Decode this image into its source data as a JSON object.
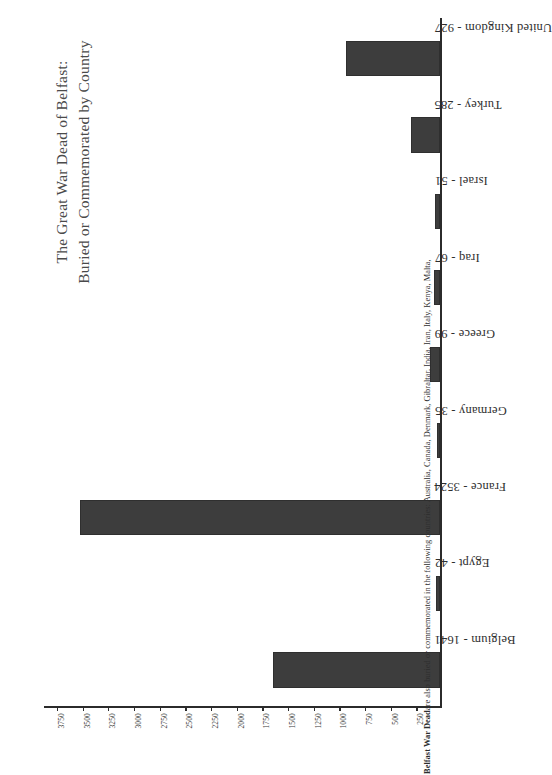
{
  "chart_data": {
    "type": "bar",
    "orientation": "horizontal",
    "title": "The Great War Dead of Belfast: Buried or Commemorated by Country",
    "title_lines": [
      "The Great War Dead of Belfast:",
      "Buried or Commemorated by Country"
    ],
    "xlabel": "",
    "ylabel": "",
    "grid": false,
    "legend": false,
    "axis_reversed": true,
    "xlim": [
      0,
      3875
    ],
    "tick_labels": [
      "3750",
      "3500",
      "3250",
      "3000",
      "2750",
      "2500",
      "2250",
      "2000",
      "1750",
      "1500",
      "1250",
      "1000",
      "750",
      "500",
      "250"
    ],
    "tick_values": [
      3750,
      3500,
      3250,
      3000,
      2750,
      2500,
      2250,
      2000,
      1750,
      1500,
      1250,
      1000,
      750,
      500,
      250
    ],
    "categories": [
      "Belgium",
      "Egypt",
      "France",
      "Germany",
      "Greece",
      "Iraq",
      "Israel",
      "Turkey",
      "United Kingdom"
    ],
    "values": [
      1641,
      42,
      3524,
      35,
      99,
      67,
      51,
      285,
      927
    ],
    "bar_labels": [
      "Belgium - 1641",
      "Egypt - 42",
      "France - 3524",
      "Germany - 35",
      "Greece - 99",
      "Iraq - 67",
      "Israel - 51",
      "Turkey - 285",
      "United Kingdom - 927"
    ],
    "bar_color": "#3d3d3d",
    "annotations": [
      "Belfast War Dead are also buried or commemorated in the following countries: Australia, Canada, Denmark, Gibraltar, India, Iran, Italy, Kenya, Malta,"
    ]
  },
  "footnote": {
    "lead": "Belfast War Dead",
    "rest": " are also buried or commemorated in the following countries: Australia, Canada, Denmark, Gibraltar, India, Iran, Italy, Kenya, Malta,"
  }
}
